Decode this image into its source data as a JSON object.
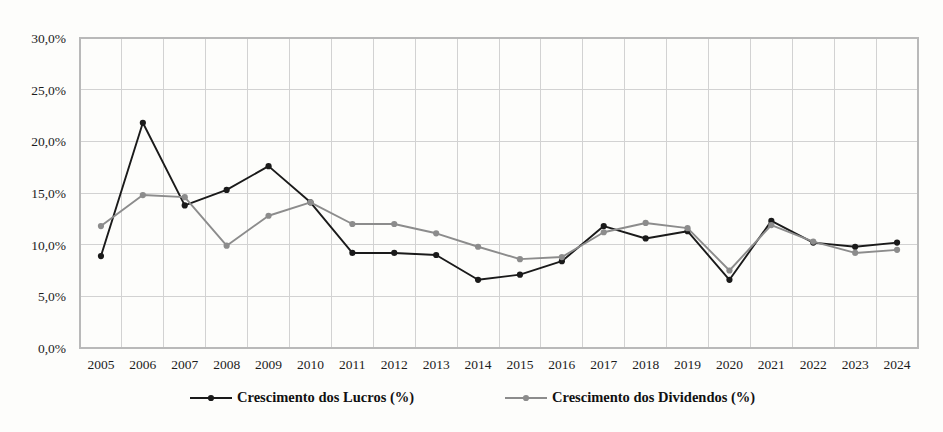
{
  "chart_data": {
    "type": "line",
    "title": "",
    "xlabel": "",
    "ylabel": "",
    "categories": [
      "2005",
      "2006",
      "2007",
      "2008",
      "2009",
      "2010",
      "2011",
      "2012",
      "2013",
      "2014",
      "2015",
      "2016",
      "2017",
      "2018",
      "2019",
      "2020",
      "2021",
      "2022",
      "2023",
      "2024"
    ],
    "series": [
      {
        "name": "Crescimento dos Lucros  (%)",
        "color": "#1a1a1a",
        "marker": "circle",
        "values": [
          8.9,
          21.8,
          13.8,
          15.3,
          17.6,
          14.1,
          9.2,
          9.2,
          9.0,
          6.6,
          7.1,
          8.4,
          11.8,
          10.6,
          11.3,
          6.6,
          12.3,
          10.2,
          9.8,
          10.2
        ]
      },
      {
        "name": "Crescimento dos Dividendos (%)",
        "color": "#8c8c8c",
        "marker": "circle",
        "values": [
          11.8,
          14.8,
          14.6,
          9.9,
          12.8,
          14.1,
          12.0,
          12.0,
          11.1,
          9.8,
          8.6,
          8.8,
          11.2,
          12.1,
          11.6,
          7.5,
          11.9,
          10.3,
          9.2,
          9.5
        ]
      }
    ],
    "ylim": [
      0,
      30
    ],
    "y_ticks": [
      "0,0%",
      "5,0%",
      "10,0%",
      "15,0%",
      "20,0%",
      "25,0%",
      "30,0%"
    ],
    "y_tick_values": [
      0,
      5,
      10,
      15,
      20,
      25,
      30
    ],
    "grid": true,
    "legend_position": "bottom",
    "background_color": "#fdfdfb",
    "gridline_color": "#d2d2d2"
  },
  "legend": {
    "entries": [
      {
        "label": "Crescimento dos Lucros  (%)",
        "color": "#1a1a1a"
      },
      {
        "label": "Crescimento dos Dividendos (%)",
        "color": "#8c8c8c"
      }
    ]
  }
}
